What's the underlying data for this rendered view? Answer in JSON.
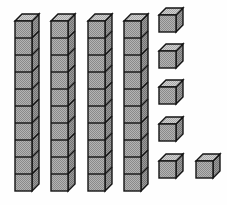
{
  "figure": {
    "kind": "base-ten-blocks",
    "projection": "cabinet-isometric",
    "total_value": 46,
    "colors": {
      "background": "#fefefe",
      "face_front": "#a9a9a9",
      "face_top": "#c9c9c9",
      "face_side": "#8f8f8f",
      "outline": "#141414",
      "dither": "#8c8c8c"
    },
    "geometry": {
      "unit_face": 17,
      "depth_x": 7,
      "depth_y": 7,
      "stroke_width": 1.4
    }
  },
  "groups": [
    {
      "name": "tens-rods",
      "label": "Tens rods",
      "count": 4,
      "cubes_per_item": 10,
      "value_per_item": 10,
      "group_value": 40,
      "items": [
        {
          "name": "rod-1",
          "x": 15,
          "y": 21,
          "units": 10
        },
        {
          "name": "rod-2",
          "x": 51,
          "y": 21,
          "units": 10
        },
        {
          "name": "rod-3",
          "x": 88,
          "y": 21,
          "units": 10
        },
        {
          "name": "rod-4",
          "x": 124,
          "y": 21,
          "units": 10
        }
      ]
    },
    {
      "name": "unit-cubes",
      "label": "Unit cubes",
      "count": 6,
      "cubes_per_item": 1,
      "value_per_item": 1,
      "group_value": 6,
      "items": [
        {
          "name": "unit-cube-1",
          "x": 159,
          "y": 15,
          "units": 1
        },
        {
          "name": "unit-cube-2",
          "x": 159,
          "y": 51,
          "units": 1
        },
        {
          "name": "unit-cube-3",
          "x": 159,
          "y": 87,
          "units": 1
        },
        {
          "name": "unit-cube-4",
          "x": 159,
          "y": 124,
          "units": 1
        },
        {
          "name": "unit-cube-5",
          "x": 159,
          "y": 161,
          "units": 1
        },
        {
          "name": "unit-cube-6",
          "x": 196,
          "y": 161,
          "units": 1
        }
      ]
    }
  ]
}
